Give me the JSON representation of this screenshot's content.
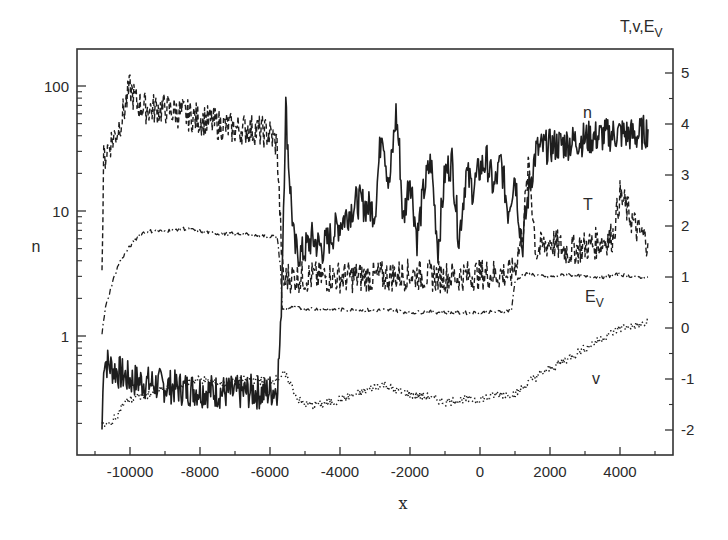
{
  "chart_data": {
    "type": "line",
    "title": "",
    "xlabel": "x",
    "ylabel_left": "n",
    "ylabel_right": "T,v,E_V",
    "ylabel_right_display": {
      "main": "T,v,E",
      "sub": "V"
    },
    "xlim": [
      -11500,
      5600
    ],
    "ylim_left": [
      0.11,
      200
    ],
    "yscale_left": "log",
    "ylim_right": [
      -2.5,
      5.5
    ],
    "x_ticks": [
      -10000,
      -8000,
      -6000,
      -4000,
      -2000,
      0,
      2000,
      4000
    ],
    "x_tick_labels": [
      "-10000",
      "-8000",
      "-6000",
      "-4000",
      "-2000",
      "0",
      "2000",
      "4000"
    ],
    "y_left_ticks": [
      1,
      10,
      100
    ],
    "y_left_tick_labels": [
      "1",
      "10",
      "100"
    ],
    "y_right_ticks": [
      -2,
      -1,
      0,
      1,
      2,
      3,
      4,
      5
    ],
    "y_right_tick_labels": [
      "-2",
      "-1",
      "0",
      "1",
      "2",
      "3",
      "4",
      "5"
    ],
    "grid": false,
    "legend": "inline curve labels",
    "annotations": [
      {
        "text": "n",
        "x": 3000,
        "y_right": 4.0
      },
      {
        "text": "T",
        "x": 3000,
        "y_right": 2.4
      },
      {
        "text": "E",
        "sub": "V",
        "x": 3000,
        "y_right": 0.7
      },
      {
        "text": "v",
        "x": 3600,
        "y_right": -1.0
      }
    ],
    "series": [
      {
        "name": "n (left axis, log)",
        "axis": "left",
        "style": "solid",
        "x": [
          -10800,
          -10750,
          -10500,
          -10000,
          -9500,
          -9000,
          -8500,
          -8000,
          -7500,
          -7000,
          -6500,
          -6200,
          -5800,
          -5700,
          -5550,
          -5450,
          -5300,
          -5100,
          -4800,
          -4500,
          -4000,
          -3500,
          -3000,
          -2800,
          -2600,
          -2400,
          -2300,
          -2200,
          -2000,
          -1800,
          -1600,
          -1400,
          -1200,
          -1000,
          -800,
          -600,
          -400,
          -200,
          0,
          200,
          400,
          600,
          800,
          1000,
          1200,
          1400,
          1600,
          1800,
          2000,
          2500,
          3000,
          3500,
          4000,
          4500,
          4800
        ],
        "values": [
          0.18,
          0.65,
          0.55,
          0.45,
          0.42,
          0.4,
          0.38,
          0.37,
          0.36,
          0.35,
          0.36,
          0.35,
          0.38,
          1.0,
          70,
          20,
          5.0,
          4.5,
          6.0,
          5.0,
          8.0,
          12.0,
          10.0,
          50,
          15,
          60,
          30,
          8,
          20,
          6,
          15,
          25,
          5,
          20,
          25,
          6,
          20,
          15,
          22,
          25,
          15,
          25,
          10,
          20,
          5,
          15,
          30,
          32,
          33,
          35,
          38,
          40,
          42,
          40,
          45
        ]
      },
      {
        "name": "T (right axis)",
        "axis": "right",
        "style": "dashed",
        "x": [
          -10800,
          -10750,
          -10600,
          -10400,
          -10200,
          -10000,
          -9800,
          -9500,
          -9000,
          -8500,
          -8000,
          -7500,
          -7000,
          -6500,
          -6000,
          -5800,
          -5700,
          -5650,
          -5600,
          -5500,
          -5000,
          -4000,
          -3000,
          -2000,
          -1000,
          0,
          500,
          900,
          1000,
          1200,
          1400,
          1600,
          1800,
          2000,
          2500,
          3000,
          3500,
          3800,
          4000,
          4500,
          4800
        ],
        "values": [
          1.15,
          3.3,
          3.6,
          3.8,
          4.2,
          4.7,
          4.4,
          4.3,
          4.3,
          4.2,
          4.1,
          4.0,
          3.9,
          3.9,
          3.8,
          3.6,
          2.0,
          1.2,
          0.9,
          1.0,
          1.0,
          1.0,
          1.0,
          1.05,
          1.0,
          1.05,
          1.05,
          1.05,
          1.2,
          1.8,
          3.2,
          1.5,
          1.6,
          1.7,
          1.5,
          1.6,
          1.7,
          1.8,
          2.6,
          1.9,
          1.7
        ]
      },
      {
        "name": "E_V (right axis)",
        "axis": "right",
        "style": "dash-dot",
        "x": [
          -10800,
          -10700,
          -10500,
          -10300,
          -10000,
          -9700,
          -9500,
          -9000,
          -8500,
          -8000,
          -7500,
          -7000,
          -6500,
          -6000,
          -5800,
          -5700,
          -5650,
          -5500,
          -5000,
          -4000,
          -3000,
          -2500,
          -2000,
          -1500,
          -1000,
          -500,
          0,
          500,
          900,
          1000,
          1200,
          1500,
          2000,
          2500,
          3000,
          3500,
          4000,
          4500,
          4800
        ],
        "values": [
          -0.1,
          0.4,
          0.9,
          1.3,
          1.6,
          1.85,
          1.9,
          1.9,
          1.95,
          1.9,
          1.85,
          1.85,
          1.82,
          1.8,
          1.8,
          1.2,
          0.35,
          0.4,
          0.38,
          0.36,
          0.35,
          0.35,
          0.3,
          0.32,
          0.3,
          0.3,
          0.3,
          0.32,
          0.35,
          0.9,
          1.05,
          1.05,
          1.0,
          1.05,
          1.0,
          1.0,
          1.05,
          1.0,
          1.0
        ]
      },
      {
        "name": "v (right axis)",
        "axis": "right",
        "style": "dotted",
        "x": [
          -10800,
          -10600,
          -10400,
          -10200,
          -10000,
          -9500,
          -9000,
          -8500,
          -8000,
          -7500,
          -7000,
          -6500,
          -6000,
          -5800,
          -5600,
          -5400,
          -5200,
          -5000,
          -4500,
          -4000,
          -3500,
          -3000,
          -2700,
          -2500,
          -2000,
          -1500,
          -1000,
          -500,
          0,
          500,
          1000,
          1500,
          2000,
          2500,
          3000,
          3500,
          4000,
          4500,
          4800
        ],
        "values": [
          -1.9,
          -1.9,
          -1.75,
          -1.5,
          -1.4,
          -1.3,
          -1.2,
          -1.1,
          -1.0,
          -1.1,
          -1.05,
          -1.0,
          -1.05,
          -1.0,
          -0.9,
          -1.1,
          -1.4,
          -1.5,
          -1.5,
          -1.4,
          -1.3,
          -1.15,
          -1.1,
          -1.2,
          -1.3,
          -1.35,
          -1.45,
          -1.4,
          -1.4,
          -1.3,
          -1.3,
          -1.0,
          -0.8,
          -0.6,
          -0.4,
          -0.2,
          0.0,
          0.05,
          0.1
        ]
      }
    ]
  },
  "labels": {
    "x_axis_title": "x",
    "left_axis_title": "n",
    "right_axis_title_main": "T,v,E",
    "right_axis_title_sub": "V",
    "curve_label_n": "n",
    "curve_label_T": "T",
    "curve_label_Ev_main": "E",
    "curve_label_Ev_sub": "V",
    "curve_label_v": "v"
  }
}
